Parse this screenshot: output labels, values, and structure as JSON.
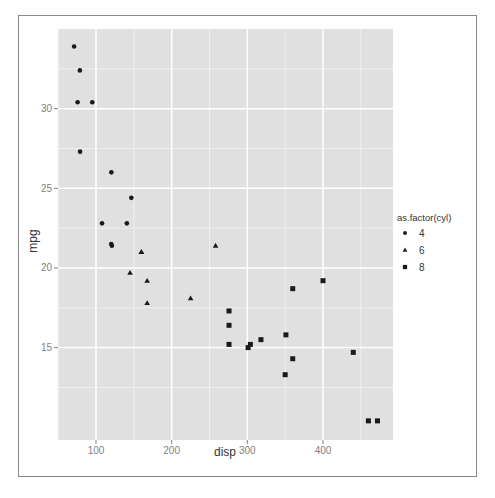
{
  "chart_data": {
    "type": "scatter",
    "title": "",
    "xlabel": "disp",
    "ylabel": "mpg",
    "xlim": [
      49.8,
      492.5
    ],
    "ylim": [
      9.2,
      35.0
    ],
    "x_ticks": [
      100,
      200,
      300,
      400
    ],
    "y_ticks": [
      15,
      20,
      25,
      30
    ],
    "x_minor": [
      50,
      150,
      250,
      350,
      450
    ],
    "y_minor": [
      12.5,
      17.5,
      22.5,
      27.5,
      32.5
    ],
    "grid": true,
    "panel_background": "#e0e0e0",
    "grid_color": "#ffffff",
    "point_color": "#1a1a1a",
    "legend": {
      "title": "as.factor(cyl)",
      "position": "right",
      "entries": [
        {
          "label": "4",
          "shape": "circle"
        },
        {
          "label": "6",
          "shape": "triangle"
        },
        {
          "label": "8",
          "shape": "square"
        }
      ]
    },
    "series": [
      {
        "name": "4",
        "shape": "circle",
        "points": [
          [
            108,
            22.8
          ],
          [
            146.7,
            24.4
          ],
          [
            140.8,
            22.8
          ],
          [
            78.7,
            32.4
          ],
          [
            75.7,
            30.4
          ],
          [
            71.1,
            33.9
          ],
          [
            120.1,
            21.5
          ],
          [
            79,
            27.3
          ],
          [
            120.3,
            26.0
          ],
          [
            95.1,
            30.4
          ],
          [
            121,
            21.4
          ]
        ]
      },
      {
        "name": "6",
        "shape": "triangle",
        "points": [
          [
            160,
            21.0
          ],
          [
            160,
            21.0
          ],
          [
            258,
            21.4
          ],
          [
            225,
            18.1
          ],
          [
            167.6,
            19.2
          ],
          [
            167.6,
            17.8
          ],
          [
            145,
            19.7
          ]
        ]
      },
      {
        "name": "8",
        "shape": "square",
        "points": [
          [
            360,
            18.7
          ],
          [
            360,
            14.3
          ],
          [
            275.8,
            16.4
          ],
          [
            275.8,
            17.3
          ],
          [
            275.8,
            15.2
          ],
          [
            472,
            10.4
          ],
          [
            460,
            10.4
          ],
          [
            440,
            14.7
          ],
          [
            318,
            15.5
          ],
          [
            304,
            15.2
          ],
          [
            350,
            13.3
          ],
          [
            400,
            19.2
          ],
          [
            351,
            15.8
          ],
          [
            301,
            15.0
          ]
        ]
      }
    ]
  }
}
